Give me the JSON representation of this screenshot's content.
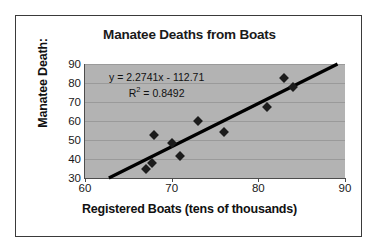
{
  "chart_data": {
    "type": "scatter",
    "title": "Manatee Deaths from Boats",
    "xlabel": "Registered Boats (tens of thousands)",
    "ylabel": "Manatee Death:",
    "xlim": [
      60,
      90
    ],
    "ylim": [
      30,
      90
    ],
    "xticks": [
      60,
      70,
      80,
      90
    ],
    "yticks": [
      30,
      40,
      50,
      60,
      70,
      80,
      90
    ],
    "grid": true,
    "legend": "none",
    "plot_background": "#b3b3b3",
    "marker_color": "#1c1c1c",
    "trendline_color": "#000000",
    "x": [
      67.0,
      67.7,
      68.0,
      70.0,
      71.0,
      73.0,
      76.0,
      81.0,
      83.0,
      84.0
    ],
    "y": [
      35.0,
      38.0,
      52.5,
      48.5,
      41.5,
      60.0,
      54.0,
      67.5,
      82.5,
      78.0
    ],
    "points": [
      {
        "x": 67.0,
        "y": 35.0
      },
      {
        "x": 67.7,
        "y": 38.0
      },
      {
        "x": 68.0,
        "y": 52.5
      },
      {
        "x": 70.0,
        "y": 48.5
      },
      {
        "x": 71.0,
        "y": 41.5
      },
      {
        "x": 73.0,
        "y": 60.0
      },
      {
        "x": 76.0,
        "y": 54.0
      },
      {
        "x": 81.0,
        "y": 67.5
      },
      {
        "x": 83.0,
        "y": 82.5
      },
      {
        "x": 84.0,
        "y": 78.0
      }
    ],
    "annotations": {
      "equation": "y = 2.2741x - 112.71",
      "r_squared_prefix": "R",
      "r_squared_exponent": "2",
      "r_squared_value": " = 0.8492"
    },
    "fit": {
      "slope": 2.2741,
      "intercept": -112.71,
      "r_squared": 0.8492
    }
  }
}
